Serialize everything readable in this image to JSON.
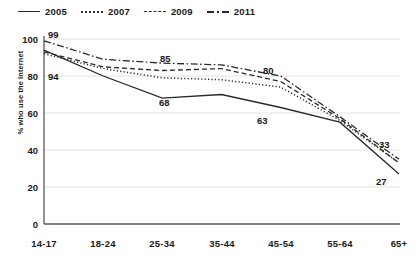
{
  "chart_data": {
    "type": "line",
    "title": "",
    "xlabel": "",
    "ylabel": "% who use the Internet",
    "categories": [
      "14-17",
      "18-24",
      "25-34",
      "35-44",
      "45-54",
      "55-64",
      "65+"
    ],
    "ylim": [
      0,
      100
    ],
    "yticks": [
      0,
      20,
      40,
      60,
      80,
      100
    ],
    "grid": true,
    "legend_position": "top-left",
    "series": [
      {
        "name": "2005",
        "style": "solid",
        "values": [
          94,
          80,
          68,
          70,
          63,
          55,
          27
        ],
        "labels": [
          {
            "category": "14-17",
            "value": 94,
            "text": "94"
          },
          {
            "category": "25-34",
            "value": 68,
            "text": "68"
          },
          {
            "category": "45-54",
            "value": 63,
            "text": "63"
          },
          {
            "category": "65+",
            "value": 27,
            "text": "27"
          }
        ]
      },
      {
        "name": "2007",
        "style": "dotted",
        "values": [
          92,
          84,
          79,
          78,
          74,
          56,
          33
        ],
        "labels": []
      },
      {
        "name": "2009",
        "style": "dashed",
        "values": [
          93,
          85,
          83,
          84,
          77,
          57,
          33
        ],
        "labels": [
          {
            "category": "25-34",
            "value": 85,
            "text": "85"
          }
        ]
      },
      {
        "name": "2011",
        "style": "dash-dot",
        "values": [
          99,
          89,
          87,
          86,
          80,
          58,
          35
        ],
        "labels": [
          {
            "category": "14-17",
            "value": 99,
            "text": "99"
          },
          {
            "category": "45-54",
            "value": 80,
            "text": "80"
          },
          {
            "category": "65+",
            "value": 33,
            "text": "33"
          }
        ]
      }
    ]
  },
  "legend": {
    "items": [
      {
        "label": "2005",
        "style": "solid"
      },
      {
        "label": "2007",
        "style": "dotted"
      },
      {
        "label": "2009",
        "style": "dashed"
      },
      {
        "label": "2011",
        "style": "dash-dot"
      }
    ]
  },
  "axes": {
    "y_title": "% who use the Internet",
    "y_ticks": [
      "100",
      "80",
      "60",
      "40",
      "20",
      "0"
    ],
    "x_ticks": [
      "14-17",
      "18-24",
      "25-34",
      "35-44",
      "45-54",
      "55-64",
      "65+"
    ]
  },
  "annotations": [
    {
      "text": "99",
      "x": 48,
      "y": 38
    },
    {
      "text": "94",
      "x": 48,
      "y": 80
    },
    {
      "text": "85",
      "x": 160,
      "y": 62
    },
    {
      "text": "68",
      "x": 159,
      "y": 106
    },
    {
      "text": "80",
      "x": 263,
      "y": 74
    },
    {
      "text": "63",
      "x": 257,
      "y": 124
    },
    {
      "text": "33",
      "x": 379,
      "y": 148
    },
    {
      "text": "27",
      "x": 376,
      "y": 185
    }
  ]
}
